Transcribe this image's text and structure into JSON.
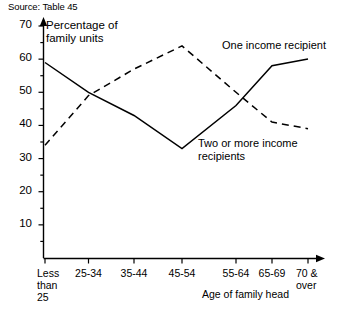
{
  "source_note": "Source: Table 45",
  "axis_titles": {
    "y": "Percentage of family units",
    "x": "Age of family head"
  },
  "series_labels": {
    "one": "One income recipient",
    "two": "Two or more income recipients"
  },
  "chart_data": {
    "type": "line",
    "title": "",
    "subtitle": "",
    "xlabel": "Age of family head",
    "ylabel": "Percentage of family units",
    "categories": [
      "Less than 25",
      "25-34",
      "35-44",
      "45-54",
      "55-64",
      "65-69",
      "70 & over"
    ],
    "category_lines": [
      [
        "Less",
        "than",
        "25"
      ],
      [
        "25-34"
      ],
      [
        "35-44"
      ],
      [
        "45-54"
      ],
      [
        "55-64"
      ],
      [
        "65-69"
      ],
      [
        "70 &",
        "over"
      ]
    ],
    "ylim": [
      0,
      70
    ],
    "yticks": [
      10,
      20,
      30,
      40,
      50,
      60,
      70
    ],
    "ytick_labels": [
      "10",
      "20",
      "30",
      "40",
      "50",
      "60",
      "70"
    ],
    "minor_ytick_step": 5,
    "grid": false,
    "legend": "inline-annotations",
    "series": [
      {
        "name": "One income recipient",
        "style": "solid",
        "color": "#000000",
        "values": [
          59,
          50,
          43,
          33,
          46,
          58,
          60
        ]
      },
      {
        "name": "Two or more income recipients",
        "style": "dashed",
        "color": "#000000",
        "values": [
          34,
          49,
          57,
          64,
          50,
          41,
          39
        ]
      }
    ],
    "annotations": [
      "Source: Table 45"
    ]
  }
}
